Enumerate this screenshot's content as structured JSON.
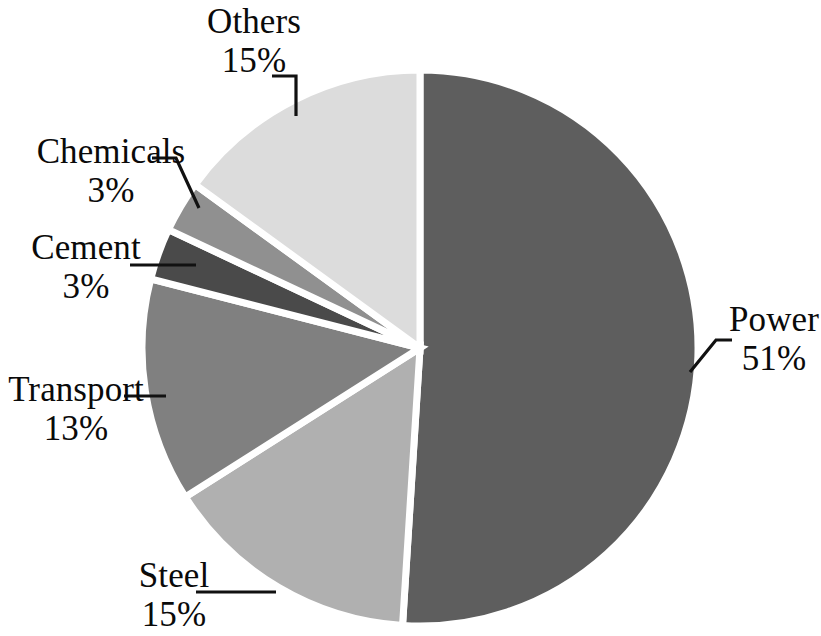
{
  "chart_data": {
    "type": "pie",
    "title": "",
    "subtitle": "",
    "xlabel": "",
    "ylabel": "",
    "legend_position": "none",
    "grid": false,
    "value_unit": "percent",
    "start_angle_deg": 0,
    "direction": "clockwise",
    "categories": [
      "Power",
      "Steel",
      "Transport",
      "Cement",
      "Chemicals",
      "Others"
    ],
    "values": [
      51,
      15,
      13,
      3,
      3,
      15
    ],
    "labels": [
      "51%",
      "15%",
      "13%",
      "3%",
      "3%",
      "15%"
    ],
    "colors": [
      "#5e5e5e",
      "#b0b0b0",
      "#808080",
      "#4a4a4a",
      "#909090",
      "#dcdcdc"
    ],
    "slices": [
      {
        "name": "Power",
        "value": 51,
        "label": "51%",
        "color": "#5e5e5e"
      },
      {
        "name": "Steel",
        "value": 15,
        "label": "15%",
        "color": "#b0b0b0"
      },
      {
        "name": "Transport",
        "value": 13,
        "label": "13%",
        "color": "#808080"
      },
      {
        "name": "Cement",
        "value": 3,
        "label": "3%",
        "color": "#4a4a4a"
      },
      {
        "name": "Chemicals",
        "value": 3,
        "label": "3%",
        "color": "#909090"
      },
      {
        "name": "Others",
        "value": 15,
        "label": "15%",
        "color": "#dcdcdc"
      }
    ]
  },
  "labels": {
    "power": {
      "name": "Power",
      "value": "51%"
    },
    "steel": {
      "name": "Steel",
      "value": "15%"
    },
    "transport": {
      "name": "Transport",
      "value": "13%"
    },
    "cement": {
      "name": "Cement",
      "value": "3%"
    },
    "chemicals": {
      "name": "Chemicals",
      "value": "3%"
    },
    "others": {
      "name": "Others",
      "value": "15%"
    }
  },
  "style": {
    "background": "#ffffff",
    "separator_color": "#ffffff",
    "text_color": "#0a0a0a",
    "leader_color": "#111111"
  }
}
